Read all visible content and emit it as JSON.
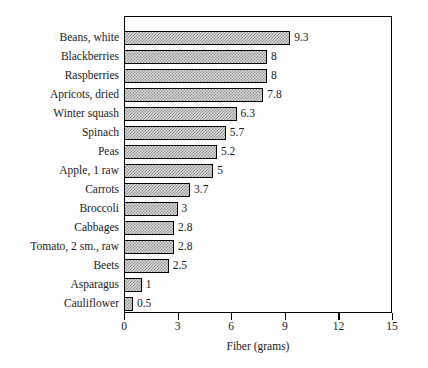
{
  "chart_data": {
    "type": "bar",
    "orientation": "horizontal",
    "title": "",
    "xlabel": "Fiber (grams)",
    "ylabel": "",
    "xlim": [
      0,
      15
    ],
    "xticks": [
      0,
      3,
      6,
      9,
      12,
      15
    ],
    "grid": false,
    "legend": null,
    "value_labels": true,
    "categories": [
      "Beans, white",
      "Blackberries",
      "Raspberries",
      "Apricots, dried",
      "Winter squash",
      "Spinach",
      "Peas",
      "Apple, 1 raw",
      "Carrots",
      "Broccoli",
      "Cabbages",
      "Tomato, 2 sm., raw",
      "Beets",
      "Asparagus",
      "Cauliflower"
    ],
    "values": [
      9.3,
      8,
      8,
      7.8,
      6.3,
      5.7,
      5.2,
      5,
      3.7,
      3,
      2.8,
      2.8,
      2.5,
      1,
      0.5
    ],
    "value_text": [
      "9.3",
      "8",
      "8",
      "7.8",
      "6.3",
      "5.7",
      "5.2",
      "5",
      "3.7",
      "3",
      "2.8",
      "2.8",
      "2.5",
      "1",
      "0.5"
    ],
    "colors": {
      "bar_fill": "#d8d8d8",
      "bar_hatch": "#8f8f8f",
      "bar_edge": "#000000",
      "axis": "#000000",
      "text": "#1a1a1a",
      "background": "#ffffff"
    }
  }
}
